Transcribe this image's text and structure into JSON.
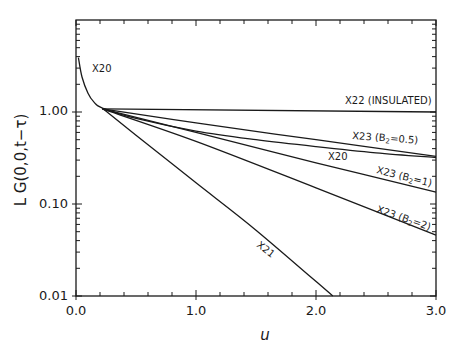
{
  "chart_data": {
    "type": "line",
    "title": "",
    "xlabel": "u",
    "ylabel": "L G(0,0,t−τ)",
    "xscale": "linear",
    "yscale": "log",
    "xlim": [
      0.0,
      3.0
    ],
    "ylim": [
      0.01,
      10.0
    ],
    "grid": false,
    "legend": "none (inline curve labels)",
    "x_ticks": [
      0.0,
      1.0,
      2.0,
      3.0
    ],
    "x_tick_labels": [
      "0.0",
      "1.0",
      "2.0",
      "3.0"
    ],
    "y_ticks": [
      0.01,
      0.1,
      1.0
    ],
    "y_tick_labels": [
      "0.01",
      "0.10",
      "1.00"
    ],
    "series": [
      {
        "name": "X20",
        "label": "X20",
        "x": [
          0.02,
          0.05,
          0.1,
          0.15,
          0.22,
          0.5,
          1.0,
          1.5,
          2.0,
          2.5,
          3.0
        ],
        "y": [
          3.9,
          2.4,
          1.6,
          1.28,
          1.1,
          0.85,
          0.62,
          0.5,
          0.42,
          0.36,
          0.32
        ]
      },
      {
        "name": "X21",
        "label": "X21",
        "x": [
          0.22,
          0.5,
          1.0,
          1.5,
          2.14
        ],
        "y": [
          1.1,
          0.56,
          0.17,
          0.052,
          0.01
        ]
      },
      {
        "name": "X22 (INSULATED)",
        "label": "X22 (INSULATED)",
        "x": [
          0.22,
          3.0
        ],
        "y": [
          1.08,
          1.0
        ]
      },
      {
        "name": "X23 (B2=0.5)",
        "label": "X23 (B₂=0.5)",
        "x": [
          0.22,
          1.0,
          2.0,
          3.0
        ],
        "y": [
          1.08,
          0.76,
          0.5,
          0.33
        ]
      },
      {
        "name": "X23 (B2=1)",
        "label": "X23 (B₂=1)",
        "x": [
          0.22,
          1.0,
          2.0,
          3.0
        ],
        "y": [
          1.08,
          0.6,
          0.28,
          0.135
        ]
      },
      {
        "name": "X23 (B2=2)",
        "label": "X23 (B₂=2)",
        "x": [
          0.22,
          1.0,
          2.0,
          3.0
        ],
        "y": [
          1.08,
          0.48,
          0.15,
          0.046
        ]
      }
    ],
    "annotations": [
      {
        "text": "X20",
        "x": 0.12,
        "y": 3.3
      },
      {
        "text": "X22 (INSULATED)",
        "x": 2.3,
        "y": 1.15
      },
      {
        "text": "X23 (B₂=0.5)",
        "x": 2.45,
        "y": 0.47
      },
      {
        "text": "X20",
        "x": 1.75,
        "y": 0.36
      },
      {
        "text": "X23 (B₂=1)",
        "x": 2.5,
        "y": 0.21
      },
      {
        "text": "X23 (B₂=2)",
        "x": 2.5,
        "y": 0.075
      },
      {
        "text": "X21",
        "x": 1.55,
        "y": 0.035
      }
    ]
  },
  "labels": {
    "xlabel": "u",
    "ylabel": "L G(0,0,t−τ)",
    "x0": "0.0",
    "x1": "1.0",
    "x2": "2.0",
    "x3": "3.0",
    "y001": "0.01",
    "y010": "0.10",
    "y100": "1.00",
    "x20_top": "X20",
    "x22": "X22 (INSULATED)",
    "x23_05": "X23 (B",
    "x23_05_sub": "2",
    "x23_05_rest": "=0.5)",
    "x20_mid": "X20",
    "x23_1": "X23 (B",
    "x23_1_sub": "2",
    "x23_1_rest": "=1)",
    "x23_2": "X23 (B",
    "x23_2_sub": "2",
    "x23_2_rest": "=2)",
    "x21": "X21"
  }
}
